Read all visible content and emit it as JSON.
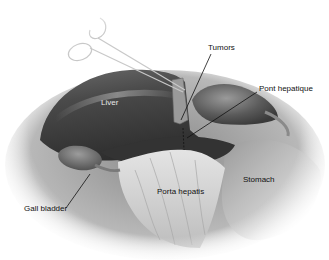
{
  "figure": {
    "type": "anatomical-illustration",
    "style": "grayscale surgical drawing",
    "labels": {
      "tumors": "Tumors",
      "pont_hepatique": "Pont hepatique",
      "liver": "Liver",
      "gall_bladder": "Gall bladder",
      "porta_hepatis": "Porta hepatis",
      "stomach": "Stomach"
    },
    "instrument": "forceps / clamp",
    "colors": {
      "background": "#ffffff",
      "liver_dark": "#3a3a3a",
      "liver_mid": "#5e5e5e",
      "tissue_light": "#d8d8d8",
      "leader_line": "#111111"
    }
  }
}
